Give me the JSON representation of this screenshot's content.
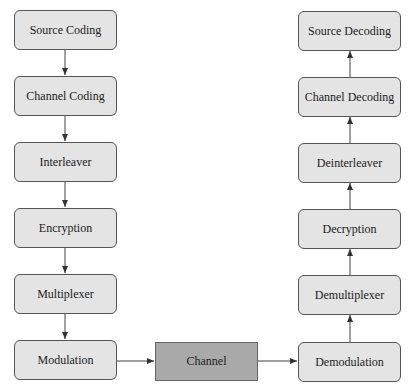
{
  "diagram": {
    "transmitter": [
      {
        "label": "Source Coding"
      },
      {
        "label": "Channel Coding"
      },
      {
        "label": "Interleaver"
      },
      {
        "label": "Encryption"
      },
      {
        "label": "Multiplexer"
      },
      {
        "label": "Modulation"
      }
    ],
    "channel": {
      "label": "Channel"
    },
    "receiver": [
      {
        "label": "Source Decoding"
      },
      {
        "label": "Channel Decoding"
      },
      {
        "label": "Deinterleaver"
      },
      {
        "label": "Decryption"
      },
      {
        "label": "Demultiplexer"
      },
      {
        "label": "Demodulation"
      }
    ],
    "colors": {
      "box_fill": "#e4e4e4",
      "channel_fill": "#a9a9a9",
      "stroke": "#555555"
    }
  }
}
